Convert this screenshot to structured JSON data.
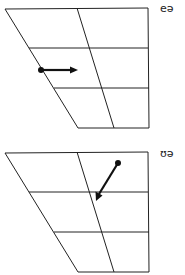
{
  "diagram": {
    "type": "vowel-quadrilateral-diphthongs",
    "line_color": "#222222",
    "arrow_color": "#111111",
    "charts": [
      {
        "label": "eə",
        "arrow": {
          "from": "front-mid (open-mid)",
          "to": "central-mid",
          "direction": "rightward"
        }
      },
      {
        "label": "ʊə",
        "arrow": {
          "from": "back near-close",
          "to": "central-mid",
          "direction": "down-left"
        }
      }
    ]
  }
}
